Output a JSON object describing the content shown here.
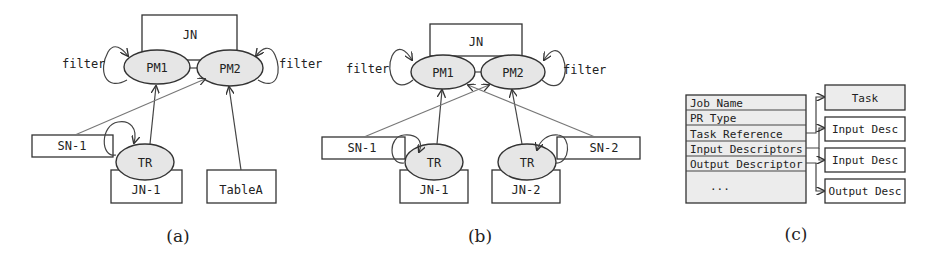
{
  "panels": {
    "a": {
      "caption": "(a)",
      "container": "JN",
      "nodes": {
        "pm1": "PM1",
        "pm2": "PM2",
        "tr": "TR",
        "sn1": "SN-1",
        "jn1": "JN-1",
        "tableA": "TableA"
      },
      "self_loop_labels": {
        "left": "filter",
        "right": "filter"
      }
    },
    "b": {
      "caption": "(b)",
      "container": "JN",
      "nodes": {
        "pm1": "PM1",
        "pm2": "PM2",
        "tr1": "TR",
        "tr2": "TR",
        "sn1": "SN-1",
        "sn2": "SN-2",
        "jn1": "JN-1",
        "jn2": "JN-2"
      },
      "self_loop_labels": {
        "left": "filter",
        "right": "filter"
      }
    },
    "c": {
      "caption": "(c)",
      "fields": [
        "Job Name",
        "PR Type",
        "Task Reference",
        "Input Descriptors",
        "Output Descriptor",
        "..."
      ],
      "targets": [
        "Task",
        "Input Desc",
        "Input Desc",
        "Output Desc"
      ]
    }
  }
}
